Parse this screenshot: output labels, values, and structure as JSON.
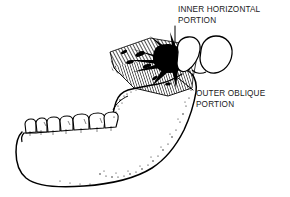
{
  "figure": {
    "background_color": "#ffffff",
    "ink_color": "#000000",
    "text_color": "#1a1a1a",
    "width": 290,
    "height": 197
  },
  "labels": [
    {
      "id": "inner-horizontal",
      "line1": "INNER HORIZONTAL",
      "line2": "PORTION",
      "leader": "vertical line descending from text into the dark muscle insertion core"
    },
    {
      "id": "outer-oblique",
      "line1": "OUTER OBLIQUE",
      "line2": "PORTION",
      "leader": "diagonal line running up-left from text into the hatched muscle fan"
    }
  ],
  "anatomy": {
    "mandible": "mandible-outline",
    "ramus": "ascending-ramus",
    "condyle": "condylar-process",
    "coronoid": "coronoid-process",
    "angle": "gonial-angle",
    "body": "mandibular-body",
    "chin": "mental-symphysis",
    "muscle": "hatched-muscle-fiber-fan",
    "insertion": "dark-muscle-insertion-core",
    "teeth_count": 7
  }
}
